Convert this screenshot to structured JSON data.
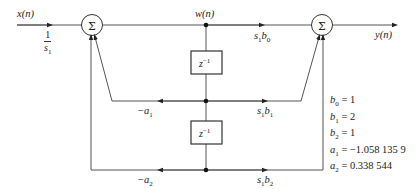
{
  "diagram": {
    "type": "second-order IIR filter signal flow graph (direct form II)",
    "input_label": "x(n)",
    "output_label": "y(n)",
    "state_label": "w(n)",
    "input_scale": {
      "numerator": "1",
      "denominator": "s",
      "denominator_sub": "1"
    },
    "adders": [
      {
        "id": "sum-left",
        "symbol": "Σ"
      },
      {
        "id": "sum-right",
        "symbol": "Σ"
      }
    ],
    "delays": [
      {
        "id": "delay-1",
        "label": "z",
        "exponent": "−1"
      },
      {
        "id": "delay-2",
        "label": "z",
        "exponent": "−1"
      }
    ],
    "gains": {
      "b0": {
        "prefix": "s",
        "prefix_sub": "1",
        "coef": "b",
        "coef_sub": "0"
      },
      "b1": {
        "prefix": "s",
        "prefix_sub": "1",
        "coef": "b",
        "coef_sub": "1"
      },
      "b2": {
        "prefix": "s",
        "prefix_sub": "1",
        "coef": "b",
        "coef_sub": "2"
      },
      "a1": {
        "sign": "−",
        "coef": "a",
        "coef_sub": "1"
      },
      "a2": {
        "sign": "−",
        "coef": "a",
        "coef_sub": "2"
      }
    },
    "parameters": [
      {
        "name": "b",
        "sub": "0",
        "value": "= 1"
      },
      {
        "name": "b",
        "sub": "1",
        "value": "= 2"
      },
      {
        "name": "b",
        "sub": "2",
        "value": "= 1"
      },
      {
        "name": "a",
        "sub": "1",
        "value": "= −1.058 135 9"
      },
      {
        "name": "a",
        "sub": "2",
        "value": "= 0.338 544"
      }
    ]
  }
}
